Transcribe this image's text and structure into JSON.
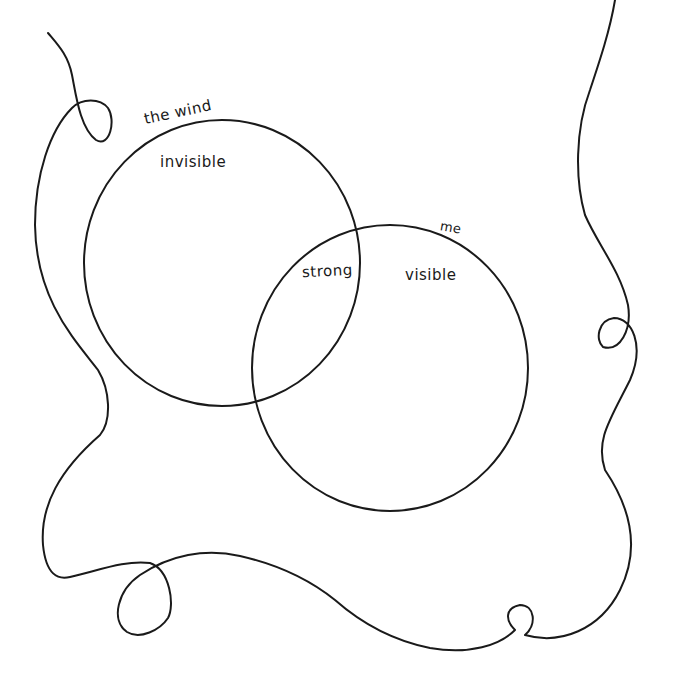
{
  "diagram": {
    "type": "venn",
    "style": "hand-drawn",
    "colors": {
      "ink": "#1a1a1a",
      "background": "#ffffff"
    },
    "sets": [
      {
        "id": "wind",
        "title": "the wind",
        "only_label": "invisible"
      },
      {
        "id": "me",
        "title": "me",
        "only_label": "visible"
      }
    ],
    "intersection": {
      "label": "strong"
    },
    "decoration": "meandering string border with loops"
  }
}
